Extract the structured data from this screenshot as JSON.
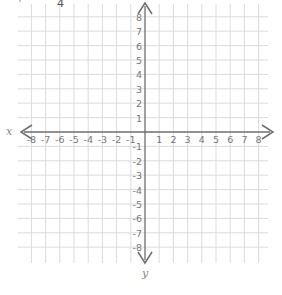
{
  "problem": {
    "fragment_label": "4"
  },
  "chart_data": {
    "type": "coordinate-plane",
    "title": "",
    "xlabel": "x",
    "ylabel": "y",
    "xlim": [
      -8,
      8
    ],
    "ylim": [
      -8,
      8
    ],
    "grid": true,
    "x_ticks": [
      "-8",
      "-7",
      "-6",
      "-5",
      "-4",
      "-3",
      "-2",
      "-1",
      "1",
      "2",
      "3",
      "4",
      "5",
      "6",
      "7",
      "8"
    ],
    "y_ticks": [
      "8",
      "7",
      "6",
      "5",
      "4",
      "3",
      "2",
      "1",
      "-1",
      "-2",
      "-3",
      "-4",
      "-5",
      "-6",
      "-7",
      "-8"
    ],
    "series": []
  },
  "colors": {
    "grid": "#dcdcdc",
    "axis": "#6e6e6e",
    "tick_label": "#777777"
  }
}
